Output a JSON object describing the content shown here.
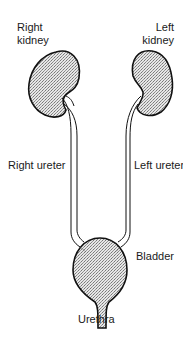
{
  "diagram": {
    "labels": {
      "right_kidney_line1": "Right",
      "right_kidney_line2": "kidney",
      "left_kidney_line1": "Left",
      "left_kidney_line2": "kidney",
      "right_ureter": "Right ureter",
      "left_ureter": "Left ureter",
      "bladder": "Bladder",
      "urethra": "Urethra"
    },
    "colors": {
      "outline": "#111111",
      "fill": "#c8c8c8",
      "background": "#ffffff"
    }
  }
}
